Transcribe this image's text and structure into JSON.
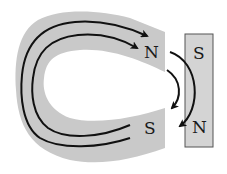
{
  "diagram": {
    "type": "magnetic-field-diagram",
    "horseshoe_magnet": {
      "pole_top_label": "N",
      "pole_bottom_label": "S",
      "fill_color": "#c9c9c9"
    },
    "bar_magnet": {
      "top_label": "S",
      "bottom_label": "N",
      "fill_color": "#d4d4d4",
      "border_color": "#555555"
    },
    "field_lines": {
      "color": "#111111",
      "count_inside_horseshoe": 2,
      "gap_arrows": 2
    }
  }
}
